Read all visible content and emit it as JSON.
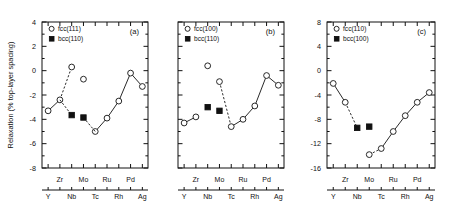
{
  "figure": {
    "ylabel": "Relaxation  (% top-layer spacing)",
    "elements_lower": [
      "Y",
      "Nb",
      "Tc",
      "Rh",
      "Ag"
    ],
    "elements_upper": [
      "Zr",
      "Mo",
      "Ru",
      "Pd"
    ]
  },
  "chart_data": [
    {
      "type": "line",
      "panel": "(a)",
      "title": "(a)",
      "xlabel": "",
      "ylabel": "Relaxation  (% top-layer spacing)",
      "categories": [
        "Y",
        "Zr",
        "Nb",
        "Mo",
        "Tc",
        "Ru",
        "Rh",
        "Pd",
        "Ag"
      ],
      "xtick_labels_lower": [
        "Y",
        "Nb",
        "Tc",
        "Rh",
        "Ag"
      ],
      "xtick_labels_upper": [
        "Zr",
        "Mo",
        "Ru",
        "Pd"
      ],
      "ylim": [
        -8,
        4
      ],
      "yticks": [
        4,
        2,
        0,
        -2,
        -4,
        -6,
        -8
      ],
      "grid": false,
      "legend_position": "top-left",
      "series": [
        {
          "name": "fcc(111)",
          "marker": "open-circle",
          "values": [
            -3.3,
            -2.4,
            0.3,
            -0.7,
            -5.0,
            -3.9,
            -2.5,
            -0.2,
            -1.3
          ],
          "connected_segments": [
            [
              0,
              1
            ],
            [
              4,
              5,
              6,
              7,
              8
            ]
          ],
          "dashed_segments": [
            [
              1,
              2
            ]
          ],
          "unconnected_points": [
            2,
            3
          ]
        },
        {
          "name": "bcc(110)",
          "marker": "filled-square",
          "values": [
            null,
            null,
            -3.65,
            -3.85,
            null,
            null,
            null,
            null,
            null
          ],
          "connected_segments": [],
          "dashed_segments": [
            [
              1,
              2
            ],
            [
              3,
              4
            ]
          ]
        }
      ]
    },
    {
      "type": "line",
      "panel": "(b)",
      "title": "(b)",
      "xlabel": "",
      "ylabel": "",
      "categories": [
        "Y",
        "Zr",
        "Nb",
        "Mo",
        "Tc",
        "Ru",
        "Rh",
        "Pd",
        "Ag"
      ],
      "xtick_labels_lower": [
        "Y",
        "Nb",
        "Tc",
        "Rh",
        "Ag"
      ],
      "xtick_labels_upper": [
        "Zr",
        "Mo",
        "Ru",
        "Pd"
      ],
      "ylim": [
        -8,
        4
      ],
      "yticks": [
        4,
        2,
        0,
        -2,
        -4,
        -6,
        -8
      ],
      "grid": false,
      "legend_position": "top-left",
      "series": [
        {
          "name": "fcc(100)",
          "marker": "open-circle",
          "values": [
            -4.3,
            -3.8,
            0.4,
            -0.9,
            -4.6,
            -4.0,
            -2.9,
            -0.4,
            -1.2
          ],
          "connected_segments": [
            [
              0,
              1
            ],
            [
              4,
              5,
              6,
              7,
              8
            ]
          ],
          "dashed_segments": [
            [
              3,
              4
            ]
          ],
          "unconnected_points": [
            2,
            3
          ]
        },
        {
          "name": "bcc(110)",
          "marker": "filled-square",
          "values": [
            null,
            null,
            -3.0,
            -3.3,
            null,
            null,
            null,
            null,
            null
          ],
          "connected_segments": [],
          "dashed_segments": []
        }
      ]
    },
    {
      "type": "line",
      "panel": "(c)",
      "title": "(c)",
      "xlabel": "",
      "ylabel": "",
      "categories": [
        "Y",
        "Zr",
        "Nb",
        "Mo",
        "Tc",
        "Ru",
        "Rh",
        "Pd",
        "Ag"
      ],
      "xtick_labels_lower": [
        "Y",
        "Nb",
        "Tc",
        "Rh",
        "Ag"
      ],
      "xtick_labels_upper": [
        "Zr",
        "Mo",
        "Ru",
        "Pd"
      ],
      "ylim": [
        -16,
        8
      ],
      "yticks": [
        8,
        4,
        0,
        -4,
        -8,
        -12,
        -16
      ],
      "grid": false,
      "legend_position": "top-left",
      "series": [
        {
          "name": "fcc(110)",
          "marker": "open-circle",
          "values": [
            -2.1,
            -5.2,
            null,
            -13.8,
            -12.8,
            -10.0,
            -7.4,
            -5.2,
            -3.6
          ],
          "connected_segments": [
            [
              0,
              1
            ],
            [
              4,
              5,
              6,
              7,
              8
            ]
          ],
          "dashed_segments": [
            [
              1,
              2
            ],
            [
              3,
              4
            ]
          ],
          "unconnected_points": [
            3
          ]
        },
        {
          "name": "bcc(100)",
          "marker": "filled-square",
          "values": [
            null,
            null,
            -9.4,
            -9.2,
            null,
            null,
            null,
            null,
            null
          ],
          "connected_segments": [],
          "dashed_segments": []
        }
      ]
    }
  ]
}
